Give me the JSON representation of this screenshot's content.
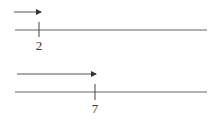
{
  "diagram": {
    "type": "number-line-arrows",
    "panels": [
      {
        "arrow": {
          "x1": 14,
          "x2": 41,
          "y": 12
        },
        "line": {
          "x1": 15,
          "x2": 207,
          "y": 30
        },
        "tick": {
          "x": 39,
          "y1": 22,
          "y2": 37
        },
        "label": {
          "text": "2",
          "x": 39,
          "y": 50
        }
      },
      {
        "arrow": {
          "x1": 17,
          "x2": 96,
          "y": 74
        },
        "line": {
          "x1": 15,
          "x2": 207,
          "y": 92
        },
        "tick": {
          "x": 95,
          "y1": 84,
          "y2": 100
        },
        "label": {
          "text": "7",
          "x": 95,
          "y": 113
        }
      }
    ],
    "colors": {
      "stroke": "#555555",
      "text": "#333333",
      "background": "#ffffff"
    }
  }
}
